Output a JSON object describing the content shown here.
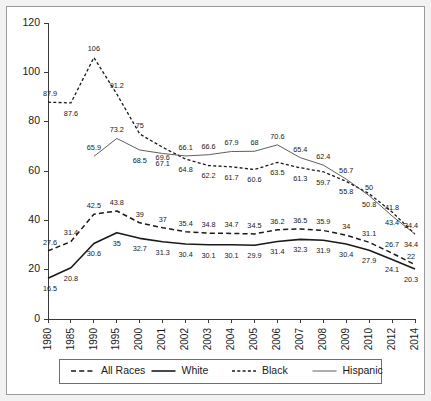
{
  "chart_data": {
    "type": "line",
    "title": "",
    "xlabel": "",
    "ylabel": "",
    "ylim": [
      0,
      120
    ],
    "yticks": [
      0,
      20,
      40,
      60,
      80,
      100,
      120
    ],
    "grid": false,
    "legend_position": "bottom",
    "categories": [
      "1980",
      "1985",
      "1990",
      "1995",
      "2000",
      "2001",
      "2002",
      "2003",
      "2004",
      "2005",
      "2006",
      "2007",
      "2008",
      "2009",
      "2010",
      "2012",
      "2014"
    ],
    "series": [
      {
        "name": "All Races",
        "style": "long-dash",
        "values": [
          27.6,
          31.4,
          42.5,
          43.8,
          39,
          37,
          35.4,
          34.8,
          34.7,
          34.5,
          36.2,
          36.5,
          35.9,
          34,
          31.1,
          26.7,
          22
        ],
        "labels": [
          "27.6",
          "31.4",
          "42.5",
          "43.8",
          "39",
          "37",
          "35.4",
          "34.8",
          "34.7",
          "34.5",
          "36.2",
          "36.5",
          "35.9",
          "34",
          "31.1",
          "26.7",
          "22"
        ]
      },
      {
        "name": "White",
        "style": "solid-thick",
        "values": [
          16.5,
          20.8,
          30.6,
          35,
          32.7,
          31.3,
          30.4,
          30.1,
          30.1,
          29.9,
          31.4,
          32.3,
          31.9,
          30.4,
          27.9,
          24.1,
          20.3
        ],
        "labels": [
          "16.5",
          "20.8",
          "30.6",
          "35",
          "32.7",
          "31.3",
          "30.4",
          "30.1",
          "30.1",
          "29.9",
          "31.4",
          "32.3",
          "31.9",
          "30.4",
          "27.9",
          "24.1",
          "20.3"
        ]
      },
      {
        "name": "Black",
        "style": "short-dash",
        "values": [
          87.9,
          87.6,
          106,
          91.2,
          75,
          69.6,
          64.8,
          62.2,
          61.7,
          60.6,
          63.5,
          61.3,
          59.7,
          55.8,
          50.8,
          43.4,
          34.4
        ],
        "labels": [
          "87.9",
          "87.6",
          "106",
          "91.2",
          "75",
          "69.6",
          "64.8",
          "62.2",
          "61.7",
          "60.6",
          "63.5",
          "61.3",
          "59.7",
          "55.8",
          "50.8",
          "43.4",
          "34.4"
        ]
      },
      {
        "name": "Hispanic",
        "style": "solid-thin",
        "values": [
          null,
          null,
          65.9,
          73.2,
          68.5,
          67.1,
          66.1,
          66.6,
          67.9,
          68,
          70.6,
          65.4,
          62.4,
          56.7,
          50,
          41.8,
          34.4
        ],
        "labels": [
          null,
          null,
          "65.9",
          "73.2",
          "68.5",
          "67.1",
          "66.1",
          "66.6",
          "67.9",
          "68",
          "70.6",
          "65.4",
          "62.4",
          "56.7",
          "50",
          "41.8",
          "34.4"
        ]
      }
    ]
  },
  "legend": {
    "items": [
      {
        "label": "All Races",
        "style": "long-dash"
      },
      {
        "label": "White",
        "style": "solid-thick"
      },
      {
        "label": "Black",
        "style": "short-dash"
      },
      {
        "label": "Hispanic",
        "style": "solid-thin"
      }
    ]
  },
  "colors": {
    "ink": "#1a1a1a",
    "axis": "#3a3a3a",
    "hispanic": "#4d4d4d",
    "frame": "#9a9a9a",
    "page": "#f2f2f2"
  }
}
